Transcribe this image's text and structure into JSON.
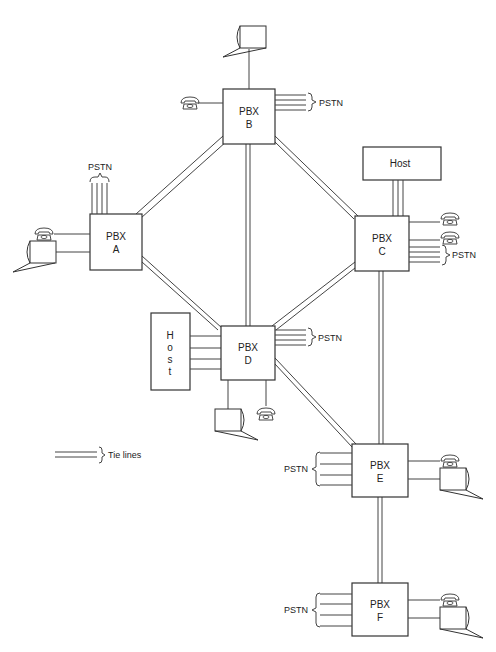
{
  "diagram": {
    "type": "network",
    "nodes": [
      {
        "id": "A",
        "line1": "PBX",
        "line2": "A"
      },
      {
        "id": "B",
        "line1": "PBX",
        "line2": "B"
      },
      {
        "id": "C",
        "line1": "PBX",
        "line2": "C"
      },
      {
        "id": "D",
        "line1": "PBX",
        "line2": "D"
      },
      {
        "id": "E",
        "line1": "PBX",
        "line2": "E"
      },
      {
        "id": "F",
        "line1": "PBX",
        "line2": "F"
      }
    ],
    "hosts": [
      {
        "id": "host-c",
        "label": "Host"
      },
      {
        "id": "host-d",
        "chars": [
          "H",
          "o",
          "s",
          "t"
        ]
      }
    ],
    "pstn_label": "PSTN",
    "tie_lines": [
      [
        "A",
        "B"
      ],
      [
        "B",
        "C"
      ],
      [
        "B",
        "D"
      ],
      [
        "A",
        "D"
      ],
      [
        "C",
        "D"
      ],
      [
        "C",
        "E"
      ],
      [
        "D",
        "E"
      ],
      [
        "E",
        "F"
      ]
    ],
    "legend": {
      "tie_lines_label": "Tie lines"
    }
  }
}
